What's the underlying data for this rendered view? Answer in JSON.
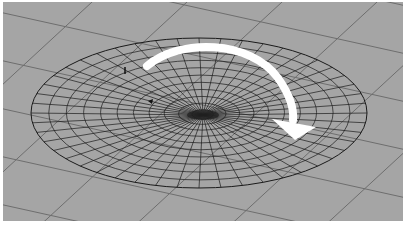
{
  "viewport": {
    "background": "#a5a5a5",
    "border": "#ffffff",
    "grid_color": "#6e6e6e",
    "wire_color": "#1a1a1a",
    "arrow_color": "#ffffff"
  },
  "scene": {
    "object": "wireframe-dish-surface",
    "center": [
      203,
      115
    ],
    "radius_x": 168,
    "radius_y": 75,
    "rings": 11,
    "spokes": 48,
    "annotation": "clockwise-rotation-arrow"
  },
  "icons": {
    "rotation_arrow": "curved-arrow-clockwise-icon",
    "locator": "locator-icon",
    "pivot": "pivot-marker-icon"
  }
}
